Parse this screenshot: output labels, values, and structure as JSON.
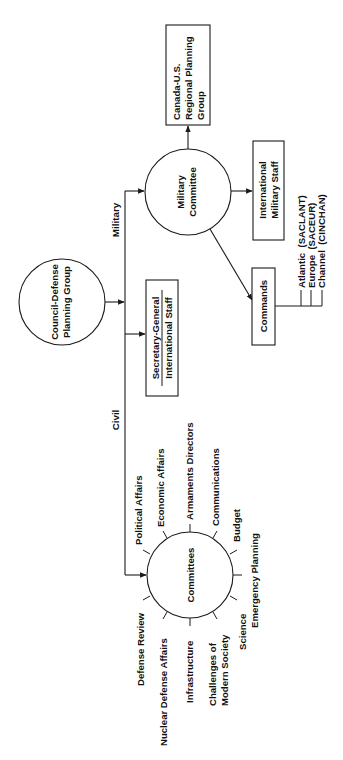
{
  "diagram": {
    "type": "organizational-chart",
    "orientation": "rotated-90-ccw",
    "colors": {
      "line": "#1a1a1a",
      "text": "#111111",
      "background": "#ffffff"
    },
    "nodes": {
      "council": {
        "line1": "Council-Defense",
        "line2": "Planning Group",
        "shape": "circle"
      },
      "secretary": {
        "line1": "Secretary-General",
        "line2": "International Staff",
        "shape": "box"
      },
      "military_committee": {
        "line1": "Military",
        "line2": "Committee",
        "shape": "circle"
      },
      "canada_us": {
        "line1": "Canada-U.S.",
        "line2": "Regional Planning",
        "line3": "Group",
        "shape": "box"
      },
      "intl_military_staff": {
        "line1": "International",
        "line2": "Military Staff",
        "shape": "box"
      },
      "commands": {
        "label": "Commands",
        "shape": "box"
      },
      "committees": {
        "label": "Committees",
        "shape": "circle"
      }
    },
    "branches": {
      "military": "Military",
      "civil": "Civil"
    },
    "commands_list": [
      "Atlantic  (SACLANT)",
      "Europe  (SACEUR)",
      "Channel  (CINCHAN)"
    ],
    "committees_list": {
      "political": "Political Affairs",
      "economic": "Economic Affairs",
      "armaments": "Armaments Directors",
      "communications": "Communications",
      "budget": "Budget",
      "emergency": "Emergency Planning",
      "science": "Science",
      "challenges_1": "Challenges of",
      "challenges_2": "Modern Society",
      "infrastructure": "Infrastructure",
      "nuclear": "Nuclear Defense Affairs",
      "defense_review": "Defense Review"
    }
  }
}
